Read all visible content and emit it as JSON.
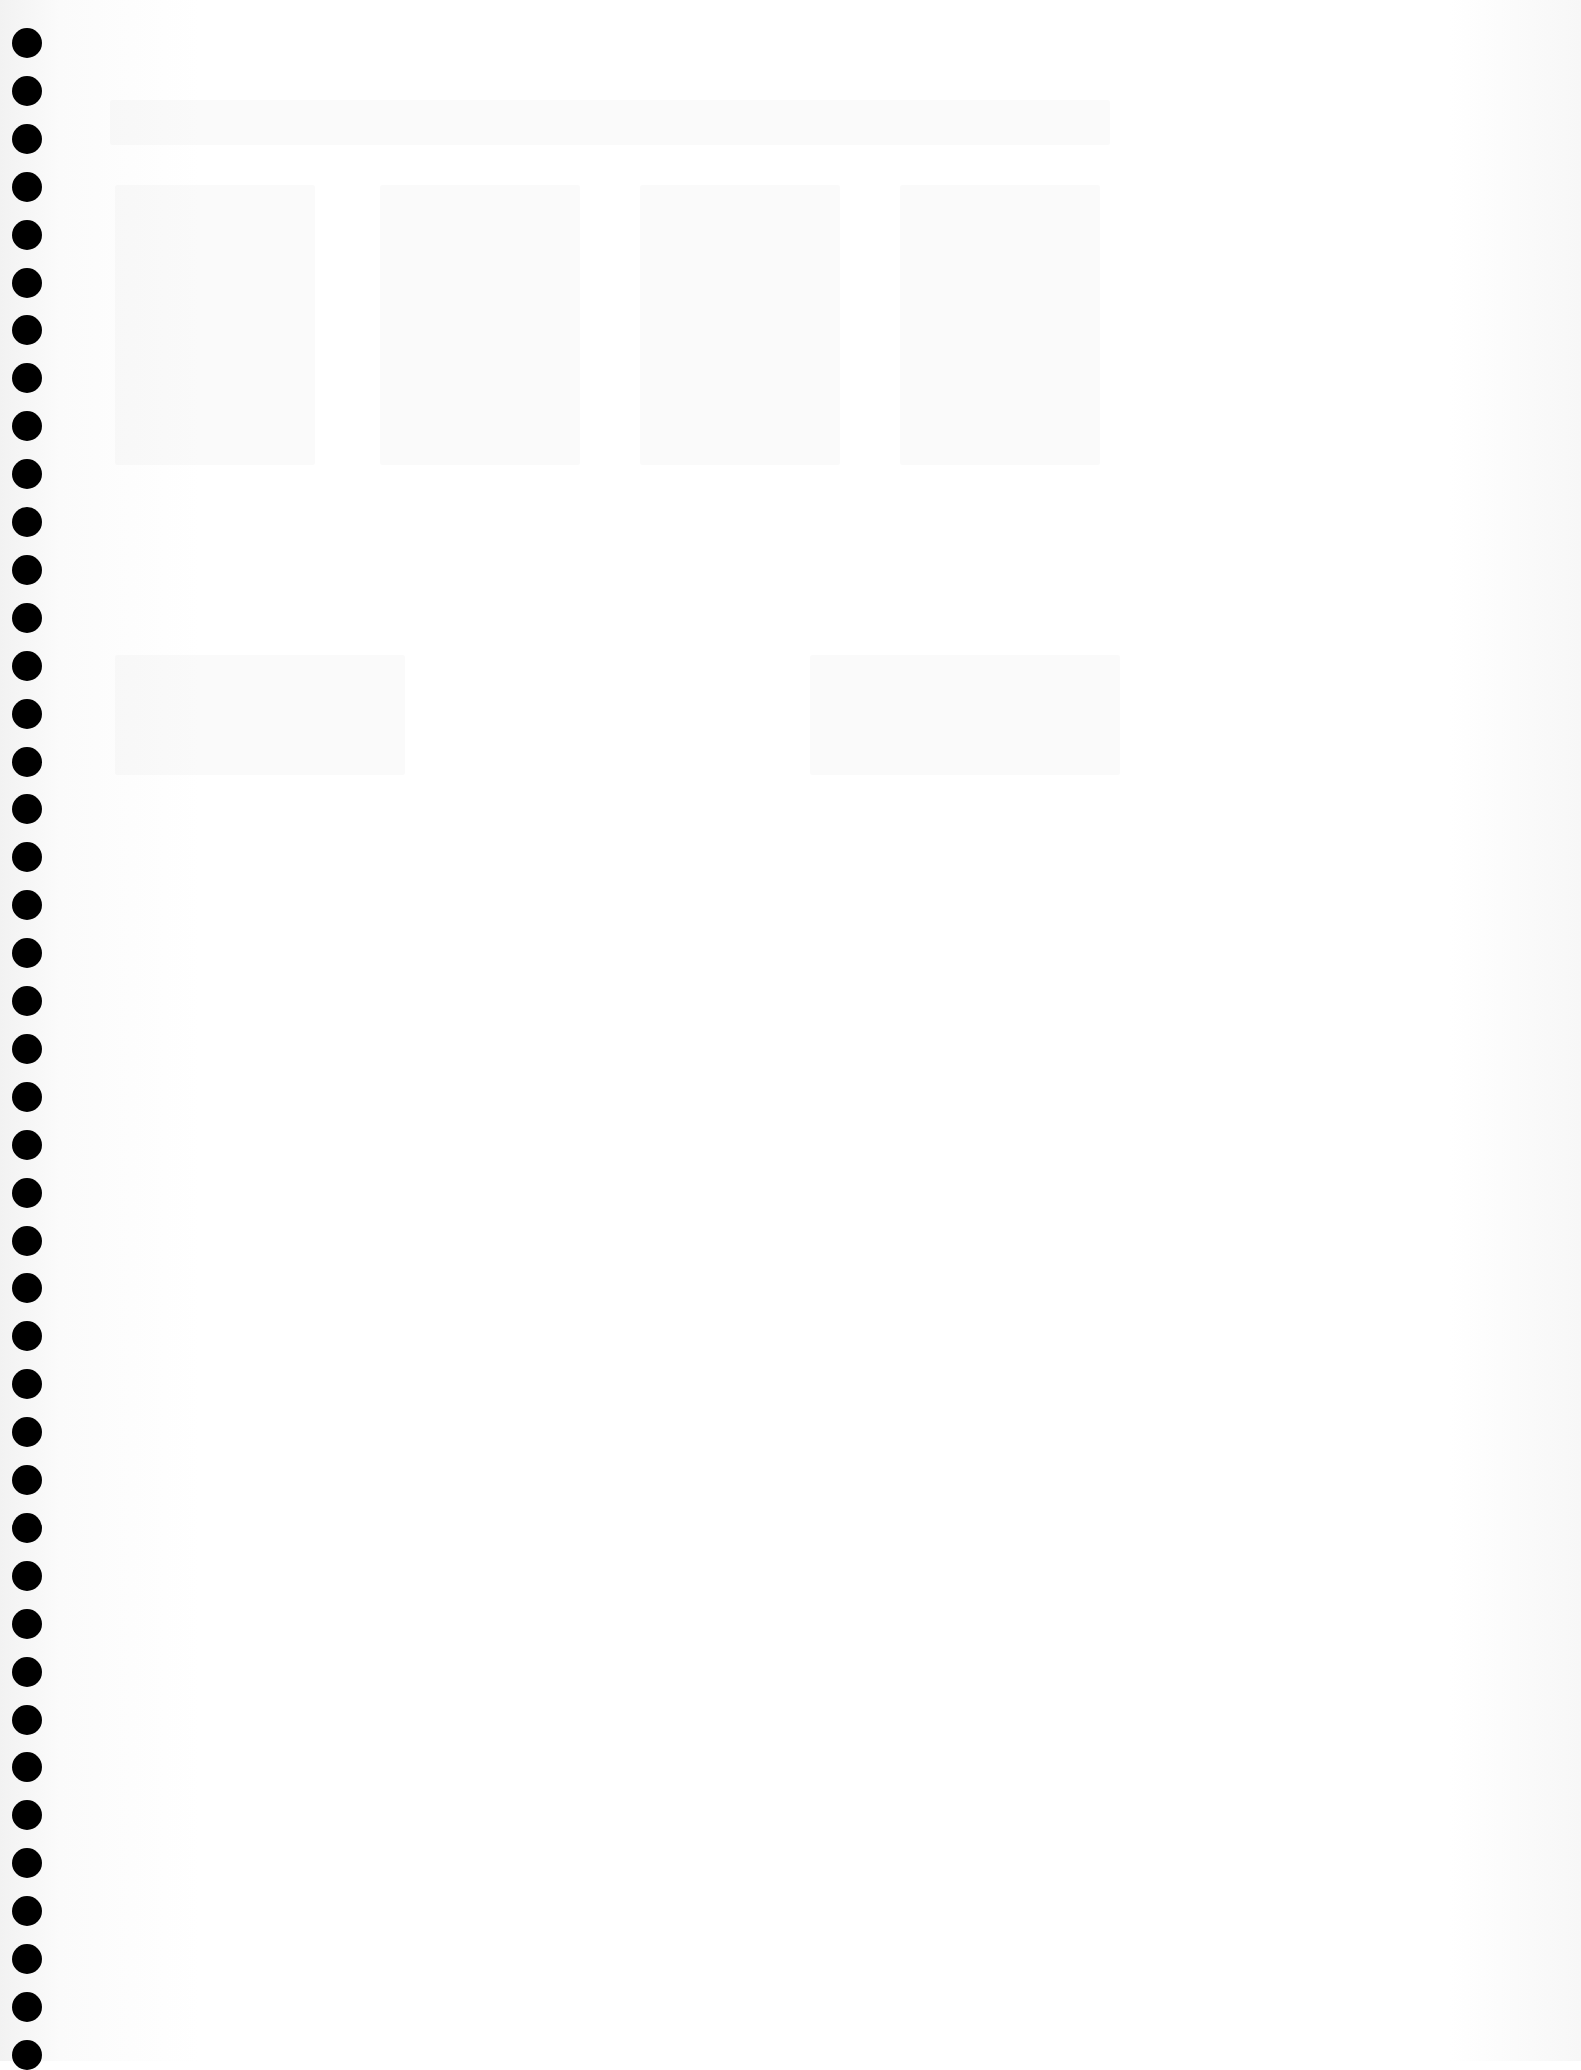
{
  "page": {
    "type": "blank scanned notebook page",
    "background_color": "#ffffff",
    "text": ""
  },
  "binding": {
    "type": "spiral holes",
    "hole_color": "#000000",
    "hole_count": 43,
    "first_hole_y": 28,
    "spacing": 47.9
  },
  "bleed_through_regions": [
    {
      "x": 110,
      "y": 100,
      "w": 1000,
      "h": 45
    },
    {
      "x": 115,
      "y": 185,
      "w": 200,
      "h": 280
    },
    {
      "x": 380,
      "y": 185,
      "w": 200,
      "h": 280
    },
    {
      "x": 640,
      "y": 185,
      "w": 200,
      "h": 280
    },
    {
      "x": 900,
      "y": 185,
      "w": 200,
      "h": 280
    },
    {
      "x": 115,
      "y": 655,
      "w": 290,
      "h": 120
    },
    {
      "x": 810,
      "y": 655,
      "w": 310,
      "h": 120
    }
  ]
}
